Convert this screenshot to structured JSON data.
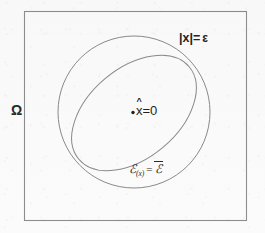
{
  "figure": {
    "canvas": {
      "width": 265,
      "height": 233
    },
    "background_color": "#fbfbfb",
    "stroke_color": "#8a8a8a",
    "text_color": "#262626",
    "domain_rect": {
      "name": "omega-domain-boundary",
      "x": 24,
      "y": 11,
      "width": 223,
      "height": 210
    },
    "outer_circle": {
      "name": "epsilon-ball-boundary",
      "cx": 134,
      "cy": 112,
      "r": 76
    },
    "inner_ellipse": {
      "name": "energy-level-set",
      "cx": 134,
      "cy": 113,
      "rx": 72,
      "ry": 45,
      "rotation_deg": -40
    },
    "center_point": {
      "name": "equilibrium-point",
      "cx": 133,
      "cy": 112,
      "r": 1.6
    },
    "labels": {
      "omega": "Ω",
      "epsilon_ball": "|x|=",
      "epsilon_symbol": "ε",
      "x_hat_variable": "x",
      "x_hat_mark": "^",
      "x_hat_equation": "=0",
      "energy_script_e": "ℰ",
      "energy_subscript": "(x)",
      "energy_equals": "=",
      "energy_bar_script_e": "ℰ"
    }
  }
}
